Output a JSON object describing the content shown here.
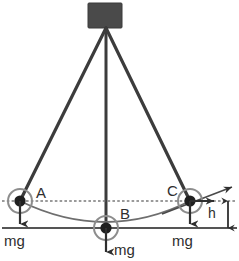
{
  "diagram": {
    "type": "physics-free-body-diagram",
    "colors": {
      "block": "#4a4a4a",
      "string": "#3c3c3c",
      "arc": "#6e6e6e",
      "baseline": "#555555",
      "dotted": "#7a7a7a",
      "label": "#2e2e2e",
      "background": "#ffffff"
    },
    "support_block": {
      "name": "ceiling-block",
      "x": 88,
      "y": 3,
      "width": 34,
      "height": 25
    },
    "pivot": {
      "x": 106,
      "y": 28
    },
    "masses": [
      {
        "id": "A",
        "label": "A",
        "label_x": 36,
        "label_y": 185,
        "cx": 20,
        "cy": 201,
        "weight_label": "mg",
        "weight_label_x": 4,
        "weight_label_y": 233
      },
      {
        "id": "B",
        "label": "B",
        "label_x": 120,
        "label_y": 206,
        "cx": 106,
        "cy": 228,
        "weight_label": "mg",
        "weight_label_x": 114,
        "weight_label_y": 242
      },
      {
        "id": "C",
        "label": "C",
        "label_x": 167,
        "label_y": 183,
        "cx": 190,
        "cy": 201,
        "weight_label": "mg",
        "weight_label_x": 172,
        "weight_label_y": 233
      }
    ],
    "height_marker": {
      "label": "h",
      "label_x": 208,
      "label_y": 206,
      "top_y": 201,
      "bottom_y": 228,
      "x": 228
    },
    "lines": {
      "dotted_level_label": "level of A and C",
      "dotted_y": 201,
      "solid_baseline_y": 228,
      "arc_label": "circular path through A, B, C"
    },
    "tangent_arrow": {
      "label": "velocity-direction-at-C"
    }
  }
}
